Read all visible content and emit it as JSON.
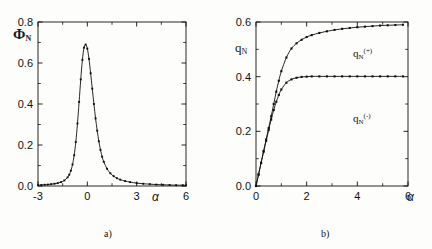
{
  "figure": {
    "background": "#fdfdfb",
    "ink": "#111111"
  },
  "panel_a": {
    "caption": "a)",
    "ylabel": "Φ",
    "ylabel_sub": "N",
    "xlabel": "α",
    "ytick_labels": [
      "0.0",
      "0.2",
      "0.4",
      "0.6",
      "0.8"
    ],
    "xtick_labels": [
      "-3",
      "0",
      "3",
      "6"
    ]
  },
  "panel_b": {
    "caption": "b)",
    "ylabel": "q",
    "ylabel_sub": "N",
    "xlabel": "α",
    "ytick_labels": [
      "0.0",
      "0.2",
      "0.4",
      "0.6"
    ],
    "xtick_labels": [
      "0",
      "2",
      "4",
      "6"
    ],
    "curve_label_upper": "q",
    "curve_label_upper_sub": "N",
    "curve_label_upper_sup": "(+)",
    "curve_label_lower": "q",
    "curve_label_lower_sub": "N",
    "curve_label_lower_sup": "(-)"
  },
  "chart_data": [
    {
      "type": "line",
      "panel": "a",
      "title": "",
      "xlabel": "α",
      "ylabel": "Φ_N",
      "xlim": [
        -3,
        6
      ],
      "ylim": [
        0.0,
        0.8
      ],
      "xticks": [
        -3,
        0,
        3,
        6
      ],
      "yticks": [
        0.0,
        0.2,
        0.4,
        0.6,
        0.8
      ],
      "grid": false,
      "legend": "none",
      "markers": "filled-square",
      "series": [
        {
          "name": "Φ_N",
          "x": [
            -3.0,
            -2.8,
            -2.6,
            -2.4,
            -2.2,
            -2.0,
            -1.8,
            -1.6,
            -1.4,
            -1.2,
            -1.1,
            -1.0,
            -0.9,
            -0.8,
            -0.7,
            -0.6,
            -0.5,
            -0.4,
            -0.3,
            -0.2,
            -0.1,
            0.0,
            0.1,
            0.2,
            0.3,
            0.4,
            0.5,
            0.6,
            0.7,
            0.8,
            0.9,
            1.0,
            1.2,
            1.4,
            1.6,
            1.8,
            2.0,
            2.3,
            2.6,
            3.0,
            3.4,
            3.8,
            4.2,
            4.6,
            5.0,
            5.4,
            5.8,
            6.0
          ],
          "y": [
            0.004,
            0.005,
            0.006,
            0.007,
            0.009,
            0.011,
            0.014,
            0.019,
            0.027,
            0.042,
            0.055,
            0.075,
            0.105,
            0.15,
            0.215,
            0.305,
            0.41,
            0.52,
            0.615,
            0.675,
            0.69,
            0.67,
            0.62,
            0.55,
            0.475,
            0.4,
            0.33,
            0.27,
            0.218,
            0.176,
            0.143,
            0.118,
            0.084,
            0.062,
            0.048,
            0.038,
            0.031,
            0.024,
            0.019,
            0.014,
            0.011,
            0.009,
            0.007,
            0.006,
            0.005,
            0.004,
            0.004,
            0.003
          ]
        }
      ]
    },
    {
      "type": "line",
      "panel": "b",
      "title": "",
      "xlabel": "α",
      "ylabel": "q_N",
      "xlim": [
        0,
        6
      ],
      "ylim": [
        0.0,
        0.6
      ],
      "xticks": [
        0,
        2,
        4,
        6
      ],
      "yticks": [
        0.0,
        0.2,
        0.4,
        0.6
      ],
      "grid": false,
      "legend": "inline-annotation",
      "markers": "filled-square",
      "series": [
        {
          "name": "q_N^(+)",
          "x": [
            0.0,
            0.1,
            0.2,
            0.3,
            0.4,
            0.5,
            0.6,
            0.7,
            0.8,
            0.9,
            1.0,
            1.2,
            1.4,
            1.6,
            1.8,
            2.0,
            2.2,
            2.5,
            2.8,
            3.1,
            3.4,
            3.7,
            4.0,
            4.3,
            4.6,
            4.9,
            5.2,
            5.5,
            5.8
          ],
          "y": [
            0.0,
            0.042,
            0.085,
            0.128,
            0.17,
            0.212,
            0.255,
            0.3,
            0.345,
            0.385,
            0.42,
            0.47,
            0.503,
            0.522,
            0.535,
            0.545,
            0.552,
            0.56,
            0.566,
            0.571,
            0.575,
            0.578,
            0.581,
            0.583,
            0.585,
            0.587,
            0.588,
            0.589,
            0.59
          ]
        },
        {
          "name": "q_N^(-)",
          "x": [
            0.0,
            0.1,
            0.2,
            0.3,
            0.4,
            0.5,
            0.6,
            0.7,
            0.8,
            0.9,
            1.0,
            1.2,
            1.4,
            1.6,
            1.8,
            2.0,
            2.2,
            2.5,
            2.8,
            3.1,
            3.4,
            3.7,
            4.0,
            4.3,
            4.6,
            4.9,
            5.2,
            5.5,
            5.8
          ],
          "y": [
            0.0,
            0.042,
            0.084,
            0.125,
            0.165,
            0.205,
            0.243,
            0.278,
            0.308,
            0.333,
            0.353,
            0.378,
            0.39,
            0.396,
            0.399,
            0.4,
            0.401,
            0.401,
            0.401,
            0.401,
            0.401,
            0.401,
            0.401,
            0.401,
            0.401,
            0.401,
            0.401,
            0.401,
            0.401
          ]
        }
      ]
    }
  ]
}
